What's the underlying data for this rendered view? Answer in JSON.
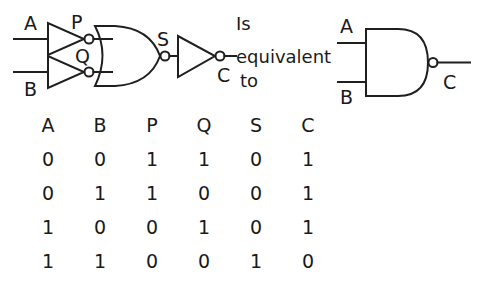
{
  "diagram": {
    "title_text": "",
    "left_circuit": {
      "inputs": [
        {
          "label": "A",
          "name": "input-a"
        },
        {
          "label": "B",
          "name": "input-b"
        }
      ],
      "intermediate_labels": [
        {
          "label": "P",
          "name": "node-p"
        },
        {
          "label": "Q",
          "name": "node-q"
        },
        {
          "label": "S",
          "name": "node-s"
        }
      ],
      "output": {
        "label": "C",
        "name": "output-c"
      },
      "gates": [
        {
          "type": "NOT",
          "name": "not-gate-a"
        },
        {
          "type": "NOT",
          "name": "not-gate-b"
        },
        {
          "type": "NOR",
          "name": "nor-gate"
        },
        {
          "type": "NOT",
          "name": "not-gate-s"
        }
      ]
    },
    "equivalence": {
      "line1": "Is",
      "line2": "equivalent",
      "line3": "to"
    },
    "right_circuit": {
      "inputs": [
        {
          "label": "A",
          "name": "nand-input-a"
        },
        {
          "label": "B",
          "name": "nand-input-b"
        }
      ],
      "output": {
        "label": "C",
        "name": "nand-output-c"
      },
      "gates": [
        {
          "type": "NAND",
          "name": "nand-gate"
        }
      ]
    }
  },
  "truth_table": {
    "headers": [
      "A",
      "B",
      "P",
      "Q",
      "S",
      "C"
    ],
    "rows": [
      [
        "0",
        "0",
        "1",
        "1",
        "0",
        "1"
      ],
      [
        "0",
        "1",
        "1",
        "0",
        "0",
        "1"
      ],
      [
        "1",
        "0",
        "0",
        "1",
        "0",
        "1"
      ],
      [
        "1",
        "1",
        "0",
        "0",
        "1",
        "0"
      ]
    ]
  },
  "colors": {
    "ink": "#1f1f1f",
    "background": "#ffffff"
  }
}
